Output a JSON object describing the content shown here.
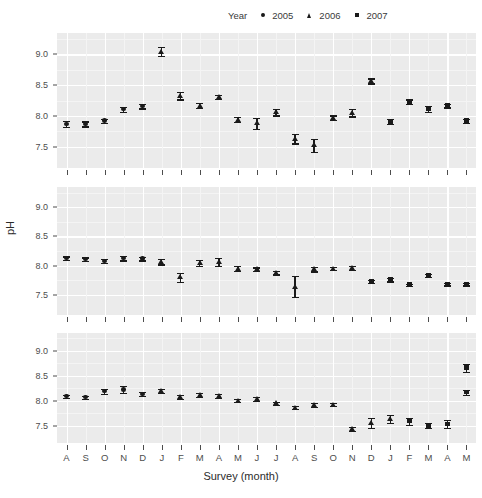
{
  "chart_data": {
    "type": "scatter",
    "title": "",
    "xlabel": "Survey (month)",
    "ylabel": "pH",
    "ylim": [
      7.15,
      9.35
    ],
    "yticks": [
      7.5,
      8.0,
      8.5,
      9.0
    ],
    "ytick_labels": [
      "7.5",
      "8.0",
      "8.5",
      "9.0"
    ],
    "grid": true,
    "legend": {
      "title": "Year",
      "position": "top-right",
      "entries": [
        {
          "label": "2005",
          "marker": "circle",
          "icon": "circle-marker-icon"
        },
        {
          "label": "2006",
          "marker": "triangle",
          "icon": "triangle-marker-icon"
        },
        {
          "label": "2007",
          "marker": "square",
          "icon": "square-marker-icon"
        }
      ]
    },
    "x": [
      "A",
      "S",
      "O",
      "N",
      "D",
      "J",
      "F",
      "M",
      "A",
      "M",
      "J",
      "J",
      "A",
      "S",
      "O",
      "N",
      "D",
      "J",
      "F",
      "M",
      "A",
      "M"
    ],
    "xtick_labels": [
      "A",
      "S",
      "O",
      "N",
      "D",
      "J",
      "F",
      "M",
      "A",
      "M",
      "J",
      "J",
      "A",
      "S",
      "O",
      "N",
      "D",
      "J",
      "F",
      "M",
      "A",
      "M"
    ],
    "panels": [
      {
        "name": "panel-1",
        "points": [
          {
            "x": "A",
            "marker": "circle",
            "y": 7.87,
            "lo": 7.82,
            "hi": 7.92
          },
          {
            "x": "S",
            "marker": "circle",
            "y": 7.87,
            "lo": 7.83,
            "hi": 7.91
          },
          {
            "x": "O",
            "marker": "circle",
            "y": 7.92,
            "lo": 7.89,
            "hi": 7.95
          },
          {
            "x": "N",
            "marker": "circle",
            "y": 8.11,
            "lo": 8.07,
            "hi": 8.15
          },
          {
            "x": "D",
            "marker": "circle",
            "y": 8.16,
            "lo": 8.12,
            "hi": 8.2
          },
          {
            "x": "J",
            "marker": "triangle",
            "y": 9.05,
            "lo": 8.98,
            "hi": 9.13
          },
          {
            "x": "F",
            "marker": "triangle",
            "y": 8.33,
            "lo": 8.27,
            "hi": 8.39
          },
          {
            "x": "M",
            "marker": "triangle",
            "y": 8.17,
            "lo": 8.13,
            "hi": 8.21
          },
          {
            "x": "A",
            "marker": "triangle",
            "y": 8.31,
            "lo": 8.28,
            "hi": 8.34
          },
          {
            "x": "M",
            "marker": "triangle",
            "y": 7.94,
            "lo": 7.9,
            "hi": 7.98
          },
          {
            "x": "J",
            "marker": "triangle",
            "y": 7.88,
            "lo": 7.79,
            "hi": 7.97
          },
          {
            "x": "J",
            "marker": "triangle",
            "y": 8.06,
            "lo": 8.01,
            "hi": 8.11
          },
          {
            "x": "A",
            "marker": "triangle",
            "y": 7.63,
            "lo": 7.55,
            "hi": 7.71
          },
          {
            "x": "S",
            "marker": "triangle",
            "y": 7.52,
            "lo": 7.41,
            "hi": 7.63
          },
          {
            "x": "O",
            "marker": "triangle",
            "y": 7.97,
            "lo": 7.93,
            "hi": 8.01
          },
          {
            "x": "N",
            "marker": "triangle",
            "y": 8.05,
            "lo": 7.99,
            "hi": 8.11
          },
          {
            "x": "D",
            "marker": "triangle",
            "y": 8.57,
            "lo": 8.53,
            "hi": 8.61
          },
          {
            "x": "J",
            "marker": "square",
            "y": 7.91,
            "lo": 7.87,
            "hi": 7.95
          },
          {
            "x": "F",
            "marker": "square",
            "y": 8.23,
            "lo": 8.19,
            "hi": 8.27
          },
          {
            "x": "M",
            "marker": "square",
            "y": 8.11,
            "lo": 8.06,
            "hi": 8.16
          },
          {
            "x": "A",
            "marker": "square",
            "y": 8.17,
            "lo": 8.14,
            "hi": 8.2
          },
          {
            "x": "M",
            "marker": "square",
            "y": 7.92,
            "lo": 7.89,
            "hi": 7.95
          }
        ]
      },
      {
        "name": "panel-2",
        "points": [
          {
            "x": "A",
            "marker": "circle",
            "y": 8.13,
            "lo": 8.1,
            "hi": 8.16
          },
          {
            "x": "S",
            "marker": "circle",
            "y": 8.11,
            "lo": 8.08,
            "hi": 8.14
          },
          {
            "x": "O",
            "marker": "circle",
            "y": 8.08,
            "lo": 8.05,
            "hi": 8.11
          },
          {
            "x": "N",
            "marker": "circle",
            "y": 8.13,
            "lo": 8.09,
            "hi": 8.17
          },
          {
            "x": "D",
            "marker": "circle",
            "y": 8.12,
            "lo": 8.09,
            "hi": 8.15
          },
          {
            "x": "J",
            "marker": "triangle",
            "y": 8.07,
            "lo": 8.02,
            "hi": 8.12
          },
          {
            "x": "F",
            "marker": "triangle",
            "y": 7.8,
            "lo": 7.72,
            "hi": 7.88
          },
          {
            "x": "M",
            "marker": "triangle",
            "y": 8.05,
            "lo": 8.0,
            "hi": 8.1
          },
          {
            "x": "A",
            "marker": "triangle",
            "y": 8.06,
            "lo": 7.99,
            "hi": 8.13
          },
          {
            "x": "M",
            "marker": "triangle",
            "y": 7.95,
            "lo": 7.91,
            "hi": 7.99
          },
          {
            "x": "J",
            "marker": "triangle",
            "y": 7.94,
            "lo": 7.91,
            "hi": 7.97
          },
          {
            "x": "J",
            "marker": "triangle",
            "y": 7.88,
            "lo": 7.85,
            "hi": 7.91
          },
          {
            "x": "A",
            "marker": "triangle",
            "y": 7.64,
            "lo": 7.46,
            "hi": 7.82
          },
          {
            "x": "S",
            "marker": "triangle",
            "y": 7.94,
            "lo": 7.9,
            "hi": 7.98
          },
          {
            "x": "O",
            "marker": "triangle",
            "y": 7.95,
            "lo": 7.92,
            "hi": 7.98
          },
          {
            "x": "N",
            "marker": "triangle",
            "y": 7.96,
            "lo": 7.93,
            "hi": 7.99
          },
          {
            "x": "D",
            "marker": "square",
            "y": 7.73,
            "lo": 7.7,
            "hi": 7.76
          },
          {
            "x": "J",
            "marker": "square",
            "y": 7.76,
            "lo": 7.73,
            "hi": 7.79
          },
          {
            "x": "F",
            "marker": "square",
            "y": 7.67,
            "lo": 7.65,
            "hi": 7.69
          },
          {
            "x": "M",
            "marker": "square",
            "y": 7.83,
            "lo": 7.8,
            "hi": 7.86
          },
          {
            "x": "A",
            "marker": "square",
            "y": 7.68,
            "lo": 7.66,
            "hi": 7.7
          },
          {
            "x": "M",
            "marker": "square",
            "y": 7.68,
            "lo": 7.66,
            "hi": 7.7
          }
        ]
      },
      {
        "name": "panel-3",
        "points": [
          {
            "x": "A",
            "marker": "circle",
            "y": 8.09,
            "lo": 8.06,
            "hi": 8.12
          },
          {
            "x": "S",
            "marker": "circle",
            "y": 8.07,
            "lo": 8.04,
            "hi": 8.1
          },
          {
            "x": "O",
            "marker": "circle",
            "y": 8.19,
            "lo": 8.14,
            "hi": 8.24
          },
          {
            "x": "N",
            "marker": "circle",
            "y": 8.22,
            "lo": 8.15,
            "hi": 8.29
          },
          {
            "x": "D",
            "marker": "circle",
            "y": 8.13,
            "lo": 8.09,
            "hi": 8.17
          },
          {
            "x": "J",
            "marker": "triangle",
            "y": 8.19,
            "lo": 8.15,
            "hi": 8.23
          },
          {
            "x": "F",
            "marker": "triangle",
            "y": 8.07,
            "lo": 8.03,
            "hi": 8.11
          },
          {
            "x": "M",
            "marker": "triangle",
            "y": 8.11,
            "lo": 8.07,
            "hi": 8.15
          },
          {
            "x": "A",
            "marker": "triangle",
            "y": 8.1,
            "lo": 8.06,
            "hi": 8.14
          },
          {
            "x": "M",
            "marker": "triangle",
            "y": 8.0,
            "lo": 7.97,
            "hi": 8.03
          },
          {
            "x": "J",
            "marker": "triangle",
            "y": 8.03,
            "lo": 7.99,
            "hi": 8.07
          },
          {
            "x": "J",
            "marker": "triangle",
            "y": 7.95,
            "lo": 7.92,
            "hi": 7.98
          },
          {
            "x": "A",
            "marker": "triangle",
            "y": 7.86,
            "lo": 7.83,
            "hi": 7.89
          },
          {
            "x": "S",
            "marker": "triangle",
            "y": 7.91,
            "lo": 7.87,
            "hi": 7.95
          },
          {
            "x": "O",
            "marker": "triangle",
            "y": 7.92,
            "lo": 7.89,
            "hi": 7.95
          },
          {
            "x": "N",
            "marker": "triangle",
            "y": 7.44,
            "lo": 7.4,
            "hi": 7.48
          },
          {
            "x": "D",
            "marker": "triangle",
            "y": 7.55,
            "lo": 7.45,
            "hi": 7.66
          },
          {
            "x": "J",
            "marker": "triangle",
            "y": 7.63,
            "lo": 7.55,
            "hi": 7.72
          },
          {
            "x": "F",
            "marker": "square",
            "y": 7.59,
            "lo": 7.52,
            "hi": 7.66
          },
          {
            "x": "M",
            "marker": "square",
            "y": 7.5,
            "lo": 7.45,
            "hi": 7.55
          },
          {
            "x": "A",
            "marker": "square",
            "y": 7.53,
            "lo": 7.45,
            "hi": 7.61
          },
          {
            "x": "M",
            "marker": "square",
            "y": 8.17,
            "lo": 8.12,
            "hi": 8.22
          },
          {
            "x": "M2",
            "marker": "square",
            "y": 8.66,
            "lo": 8.58,
            "hi": 8.74
          }
        ]
      }
    ]
  }
}
